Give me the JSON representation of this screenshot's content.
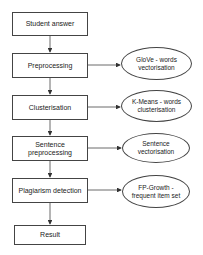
{
  "diagram": {
    "type": "flowchart",
    "steps": [
      {
        "id": "student-answer",
        "label": "Student answer"
      },
      {
        "id": "preprocessing",
        "label": "Preprocessing"
      },
      {
        "id": "clusterisation",
        "label": "Clusterisation"
      },
      {
        "id": "sentence-preprocessing",
        "label": "Sentence preprocessing"
      },
      {
        "id": "plagiarism-detection",
        "label": "Plagiarism detection"
      },
      {
        "id": "result",
        "label": "Result"
      }
    ],
    "methods": [
      {
        "attached_to": "preprocessing",
        "label": "GloVe - words vectorisation"
      },
      {
        "attached_to": "clusterisation",
        "label": "K-Means - words clusterisation"
      },
      {
        "attached_to": "sentence-preprocessing",
        "label": "Sentence vectorisation"
      },
      {
        "attached_to": "plagiarism-detection",
        "label": "FP-Growth - frequent item set"
      }
    ],
    "edges": [
      [
        "student-answer",
        "preprocessing"
      ],
      [
        "preprocessing",
        "clusterisation"
      ],
      [
        "clusterisation",
        "sentence-preprocessing"
      ],
      [
        "sentence-preprocessing",
        "plagiarism-detection"
      ],
      [
        "plagiarism-detection",
        "result"
      ],
      [
        "preprocessing",
        "GloVe - words vectorisation"
      ],
      [
        "clusterisation",
        "K-Means - words clusterisation"
      ],
      [
        "sentence-preprocessing",
        "Sentence vectorisation"
      ],
      [
        "plagiarism-detection",
        "FP-Growth - frequent item set"
      ]
    ],
    "colors": {
      "stroke": "#444444",
      "fill": "#ffffff",
      "text": "#222222"
    }
  }
}
